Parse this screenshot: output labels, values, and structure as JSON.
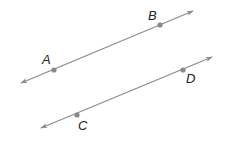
{
  "diagram": {
    "colors": {
      "line": "#8a8a8a",
      "point": "#8a8a8a",
      "label": "#222222",
      "background": "#ffffff"
    },
    "lines": [
      {
        "name": "line-ab",
        "start": [
          21,
          83
        ],
        "end": [
          193,
          11
        ],
        "arrows": "both",
        "points": [
          {
            "label": "A",
            "x": 54,
            "y": 70,
            "label_x": 42,
            "label_y": 64
          },
          {
            "label": "B",
            "x": 160,
            "y": 25,
            "label_x": 148,
            "label_y": 20
          }
        ]
      },
      {
        "name": "line-cd",
        "start": [
          41,
          128
        ],
        "end": [
          212,
          57
        ],
        "arrows": "both",
        "points": [
          {
            "label": "C",
            "x": 77,
            "y": 115,
            "label_x": 78,
            "label_y": 130
          },
          {
            "label": "D",
            "x": 183,
            "y": 70,
            "label_x": 186,
            "label_y": 83
          }
        ]
      }
    ]
  }
}
